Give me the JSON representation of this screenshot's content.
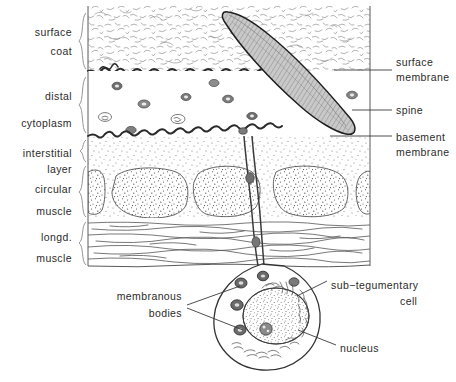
{
  "figure": {
    "background": "#ffffff",
    "ink": "#2b2b2b"
  },
  "left_labels": [
    {
      "id": "surface-coat",
      "lines": [
        "surface",
        "coat"
      ],
      "x": 72,
      "y": [
        33,
        52
      ],
      "brace": {
        "x": 84,
        "y1": 13,
        "y2": 69
      }
    },
    {
      "id": "distal-cytoplasm",
      "lines": [
        "distal",
        "cytoplasm"
      ],
      "x": 72,
      "y": [
        97,
        124
      ],
      "brace": {
        "x": 84,
        "y1": 77,
        "y2": 133
      }
    },
    {
      "id": "interstitial-layer",
      "lines": [
        "interstitial",
        "layer"
      ],
      "x": 72,
      "y": [
        154,
        170
      ],
      "brace": {
        "x": 84,
        "y1": 140,
        "y2": 162
      }
    },
    {
      "id": "circular-muscle",
      "lines": [
        "circular",
        "muscle"
      ],
      "x": 72,
      "y": [
        190,
        212
      ],
      "brace": {
        "x": 84,
        "y1": 166,
        "y2": 217
      }
    },
    {
      "id": "longd-muscle",
      "lines": [
        "longd.",
        "muscle"
      ],
      "x": 72,
      "y": [
        238,
        259
      ],
      "brace": {
        "x": 84,
        "y1": 222,
        "y2": 265
      }
    }
  ],
  "right_labels": [
    {
      "id": "surface-membrane",
      "lines": [
        "surface",
        "membrane"
      ],
      "x": 396,
      "y": [
        63,
        78
      ],
      "align": "start"
    },
    {
      "id": "spine",
      "lines": [
        "spine"
      ],
      "x": 396,
      "y": [
        113
      ],
      "align": "start"
    },
    {
      "id": "basement-membrane",
      "lines": [
        "basement",
        "membrane"
      ],
      "x": 396,
      "y": [
        138,
        153
      ],
      "align": "start"
    },
    {
      "id": "sub-tegumentary-cell",
      "lines": [
        "sub−tegumentary",
        "cell"
      ],
      "x": 331,
      "y": [
        286,
        302
      ],
      "align": "start"
    },
    {
      "id": "nucleus",
      "lines": [
        "nucleus"
      ],
      "x": 340,
      "y": [
        349
      ],
      "align": "start"
    }
  ],
  "inner_labels": [
    {
      "id": "membranous-bodies",
      "lines": [
        "membranous",
        "bodies"
      ],
      "x": 182,
      "y": [
        297,
        313
      ],
      "align": "end"
    }
  ],
  "leaders": [
    {
      "id": "leader-surface-membrane",
      "points": "392,70 334,70"
    },
    {
      "id": "leader-spine",
      "points": "392,110 352,110"
    },
    {
      "id": "leader-basement-membrane",
      "points": "392,136 330,136"
    },
    {
      "id": "leader-subteg-cell",
      "points": "327,281 297,296"
    },
    {
      "id": "leader-nucleus",
      "points": "336,345 300,330"
    },
    {
      "id": "leader-membranous-1",
      "points": "187,306 240,286"
    },
    {
      "id": "leader-membranous-2",
      "points": "187,308 243,330"
    }
  ],
  "panel": {
    "left": 88,
    "right": 370,
    "top": 6,
    "bottom": 266,
    "surface_coat": {
      "y1": 6,
      "y2": 71
    },
    "distal_cytoplasm": {
      "y1": 71,
      "y2": 136
    },
    "interstitial_layer": {
      "y1": 136,
      "y2": 165
    },
    "circular_muscle": {
      "y1": 165,
      "y2": 218
    },
    "longd_muscle": {
      "y1": 218,
      "y2": 266
    }
  },
  "spine": {
    "fill": "#b9b9b9",
    "outline": "#1f1f1f",
    "tip": [
      228,
      12
    ],
    "base": [
      350,
      136
    ],
    "description": "curved tapering blade crossing the surface coat and distal cytoplasm"
  },
  "membranes": {
    "surface_membrane_y": 71,
    "basement_membrane_y": 136,
    "color": "#2a2a2a"
  },
  "cell": {
    "id": "sub-tegumentary-cell-body",
    "outline": "#333333",
    "center": [
      268,
      310
    ],
    "nucleus": {
      "center": [
        275,
        315
      ],
      "rx": 32,
      "ry": 28,
      "fill": "#ffffff",
      "stipple": true
    },
    "membranous_body_count": 5
  },
  "stalk": {
    "from": [
      248,
      136
    ],
    "to": [
      258,
      268
    ],
    "description": "cytoplasmic connection from basement membrane to sub-tegumentary cell"
  },
  "colors": {
    "ink": "#2b2b2b",
    "line": "#3a3a3a",
    "brace": "#8a8a8a",
    "spine_fill": "#b9b9b9",
    "stipple": "#555555",
    "paper": "#ffffff"
  }
}
